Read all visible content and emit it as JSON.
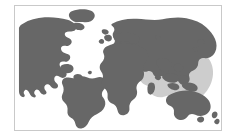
{
  "figure": {
    "kind": "world-map",
    "title": "",
    "caption": "",
    "projection": "equirectangular",
    "border_color": "#c9c9c9",
    "background_color": "#ffffff"
  },
  "map": {
    "ocean_color": "#ffffff",
    "land_color": "#676767",
    "highlight_color": "#cdcdcd",
    "land_label": "World landmasses",
    "highlight_label": "Highlighted region: Southeast Asia, Indonesia, New Guinea and the western Pacific",
    "regions": [
      {
        "name": "north-america",
        "label": "North America",
        "color": "#676767"
      },
      {
        "name": "south-america",
        "label": "South America",
        "color": "#676767"
      },
      {
        "name": "greenland",
        "label": "Greenland",
        "color": "#676767"
      },
      {
        "name": "europe",
        "label": "Europe",
        "color": "#676767"
      },
      {
        "name": "africa",
        "label": "Africa",
        "color": "#676767"
      },
      {
        "name": "asia",
        "label": "Asia",
        "color": "#676767"
      },
      {
        "name": "australia",
        "label": "Australia",
        "color": "#676767"
      },
      {
        "name": "new-zealand",
        "label": "New Zealand",
        "color": "#676767"
      },
      {
        "name": "japan",
        "label": "Japan",
        "color": "#676767"
      },
      {
        "name": "madagascar",
        "label": "Madagascar",
        "color": "#676767"
      },
      {
        "name": "british-isles",
        "label": "British Isles",
        "color": "#676767"
      },
      {
        "name": "indonesia-highlight",
        "label": "Southeast Asia / Oceania highlight",
        "color": "#cdcdcd"
      }
    ]
  }
}
